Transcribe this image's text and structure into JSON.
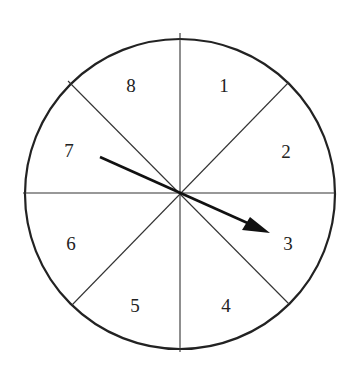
{
  "spinner": {
    "center": [
      180,
      194
    ],
    "radius": 155,
    "sections": [
      {
        "label": "1",
        "x": 224,
        "y": 92
      },
      {
        "label": "2",
        "x": 286,
        "y": 158
      },
      {
        "label": "3",
        "x": 288,
        "y": 250
      },
      {
        "label": "4",
        "x": 226,
        "y": 312
      },
      {
        "label": "5",
        "x": 135,
        "y": 312
      },
      {
        "label": "6",
        "x": 71,
        "y": 250
      },
      {
        "label": "7",
        "x": 69,
        "y": 157
      },
      {
        "label": "8",
        "x": 131,
        "y": 92
      }
    ],
    "arrow": {
      "from": [
        100,
        157
      ],
      "to": [
        270,
        233
      ],
      "points_to": "3"
    }
  }
}
